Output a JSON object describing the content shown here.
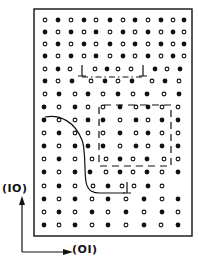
{
  "figure": {
    "type": "crystal-lattice-schematic",
    "colors": {
      "ink": "#111111",
      "background": "#ffffff"
    }
  },
  "axes": {
    "vertical_label": "(IO)",
    "horizontal_label": "(OI)"
  },
  "frame": {
    "x": 34,
    "y": 9,
    "width": 158,
    "height": 227
  },
  "legend": {
    "filled_atom": "solid dot",
    "open_atom": "open circle",
    "dislocation": "⊥"
  },
  "rows": [
    {
      "y": 20,
      "atoms": "o•o•o•o•o•o•",
      "x": [
        45,
        58,
        71,
        84,
        96,
        110,
        123,
        135,
        148,
        161,
        173,
        184
      ]
    },
    {
      "y": 32,
      "atoms": "•o•o•o•o•o•o",
      "x": [
        45,
        58,
        71,
        84,
        96,
        110,
        123,
        135,
        148,
        161,
        173,
        184
      ]
    },
    {
      "y": 44,
      "atoms": "o•o•o•o•o•o•",
      "x": [
        45,
        58,
        71,
        84,
        96,
        110,
        123,
        135,
        148,
        161,
        173,
        184
      ]
    },
    {
      "y": 56,
      "atoms": "•o•o•o•o•o•o",
      "x": [
        45,
        58,
        71,
        84,
        96,
        110,
        123,
        135,
        148,
        161,
        173,
        184
      ]
    },
    {
      "y": 69,
      "atoms": "o•oo•oo•o•",
      "x": [
        45,
        58,
        70,
        95,
        107,
        118,
        131,
        155,
        167,
        180
      ]
    },
    {
      "y": 81,
      "atoms": "•o•o•o•o•o",
      "x": [
        45,
        58,
        72,
        91,
        105,
        118,
        132,
        152,
        165,
        179
      ]
    },
    {
      "y": 94,
      "atoms": "o•o•o•o•o•",
      "x": [
        45,
        59,
        75,
        88,
        103,
        118,
        133,
        147,
        164,
        179
      ]
    },
    {
      "y": 107,
      "atoms": "•o•oo•o•oo",
      "x": [
        44,
        59,
        75,
        88,
        103,
        120,
        136,
        148,
        162,
        178
      ]
    },
    {
      "y": 120,
      "atoms": "•oo•|•o•o•|•",
      "x": [
        44,
        59,
        75,
        88,
        103,
        120,
        136,
        148,
        162,
        178
      ]
    },
    {
      "y": 133,
      "atoms": "o•oo|o•o•o|o",
      "x": [
        44,
        59,
        75,
        88,
        103,
        120,
        136,
        148,
        162,
        178
      ]
    },
    {
      "y": 146,
      "atoms": "•o••|•o•o•|•",
      "x": [
        44,
        59,
        75,
        88,
        103,
        120,
        136,
        148,
        162,
        178
      ]
    },
    {
      "y": 159,
      "atoms": "o•oo|o•o•o|o",
      "x": [
        44,
        59,
        75,
        92,
        106,
        120,
        133,
        147,
        164,
        178
      ]
    },
    {
      "y": 172,
      "atoms": "•o••o•o•o•",
      "x": [
        44,
        59,
        75,
        90,
        106,
        120,
        133,
        147,
        162,
        178
      ]
    },
    {
      "y": 186,
      "atoms": "o•oo•o⊥o•o",
      "x": [
        44,
        59,
        75,
        93,
        108,
        122,
        134,
        148,
        162,
        178
      ]
    },
    {
      "y": 199,
      "atoms": "•o•o•o•o•",
      "x": [
        44,
        59,
        75,
        92,
        108,
        126,
        144,
        162,
        178
      ]
    },
    {
      "y": 212,
      "atoms": "o•o•o•o•o",
      "x": [
        44,
        59,
        75,
        92,
        108,
        126,
        144,
        162,
        178
      ]
    },
    {
      "y": 225,
      "atoms": "•o•o•o•o•",
      "x": [
        44,
        59,
        75,
        92,
        108,
        126,
        144,
        161,
        178
      ]
    }
  ],
  "dislocations": [
    {
      "x": 82,
      "y": 71
    },
    {
      "x": 143,
      "y": 71
    },
    {
      "x": 127,
      "y": 188
    }
  ],
  "boundaries": [
    {
      "kind": "dash-dot",
      "points": "82,77 143,77"
    },
    {
      "kind": "dashed",
      "points": "99,107 99,166 171,166 171,105 99,105"
    },
    {
      "kind": "solid-curve",
      "path": "M45,117 C60,114 75,122 82,140 C86,150 84,170 86,182 C88,192 94,193 100,193 L125,193"
    }
  ]
}
